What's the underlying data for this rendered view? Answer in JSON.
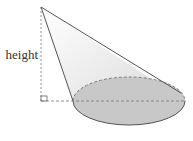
{
  "diagram": {
    "type": "oblique-cone",
    "labels": {
      "height": "height"
    },
    "apex": [
      41,
      7
    ],
    "base_ellipse": {
      "cx": 129,
      "cy": 101,
      "rx": 56,
      "ry": 24
    },
    "right_angle_marker": true,
    "colors": {
      "outline": "#555555",
      "base_fill": "#c8c8c8",
      "dashed": "#777777"
    }
  }
}
